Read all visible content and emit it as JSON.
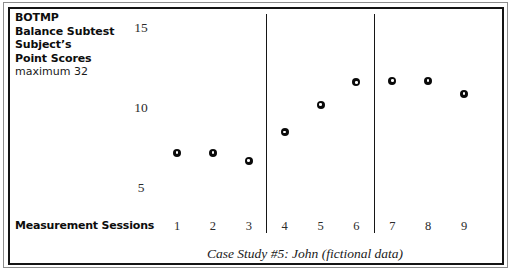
{
  "figure": {
    "caption": "Case Study #5: John (fictional data)",
    "x_axis_label": "Measurement Sessions",
    "header": {
      "lines": [
        "BOTMP",
        "Balance Subtest",
        "Subject’s",
        "Point Scores"
      ],
      "subtitle": "maximum 32"
    }
  },
  "chart_data": {
    "type": "scatter",
    "title": "Case Study #5: John (fictional data)",
    "subtitle": "BOTMP Balance Subtest Subject’s Point Scores, maximum 32",
    "xlabel": "Measurement Sessions",
    "ylabel": "BOTMP Balance Subtest Subject's Point Scores",
    "x": [
      1,
      2,
      3,
      4,
      5,
      6,
      7,
      8,
      9
    ],
    "categories": [
      "1",
      "2",
      "3",
      "4",
      "5",
      "6",
      "7",
      "8",
      "9"
    ],
    "values": [
      7.2,
      7.2,
      6.7,
      8.5,
      10.2,
      11.6,
      11.7,
      11.7,
      10.9
    ],
    "xtick_labels": [
      "1",
      "2",
      "3",
      "4",
      "5",
      "6",
      "7",
      "8",
      "9"
    ],
    "ytick_labels": [
      "15",
      "10",
      "5"
    ],
    "ytick_values": [
      15,
      10,
      5
    ],
    "ylim": [
      3.7,
      15.8
    ],
    "xlim": [
      0.4,
      9.6
    ],
    "grid": false,
    "legend": false,
    "marker": "open-circle",
    "marker_color": "#0a0a0a",
    "phase_dividers": [
      3.5,
      6.5
    ],
    "phases": [
      {
        "name": "A1",
        "sessions": [
          "1",
          "2",
          "3"
        ]
      },
      {
        "name": "B",
        "sessions": [
          "4",
          "5",
          "6"
        ]
      },
      {
        "name": "A2",
        "sessions": [
          "7",
          "8",
          "9"
        ]
      }
    ]
  },
  "colors": {
    "frame": "#141414",
    "outer_frame": "#8d8d8d",
    "text": "#1a1a1a",
    "marker": "#0a0a0a",
    "background": "#ffffff"
  }
}
